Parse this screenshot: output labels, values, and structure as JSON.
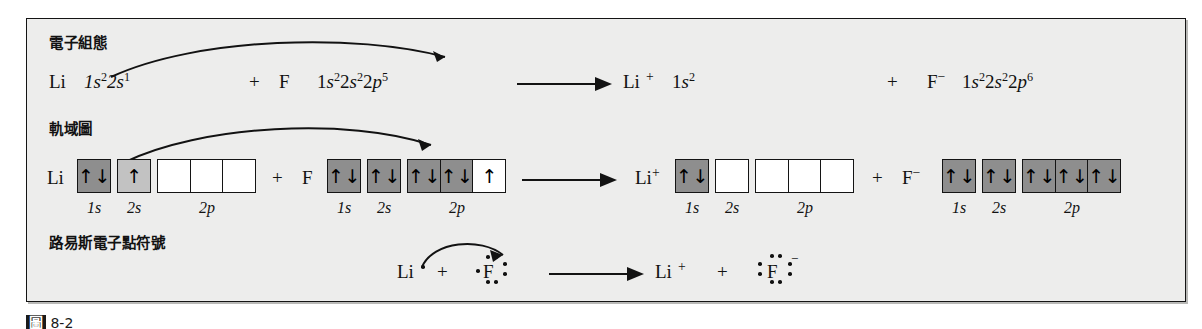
{
  "figure": {
    "background_color": "#ededec",
    "border_color": "#141414",
    "page_color": "#ffffff"
  },
  "rows": {
    "electron_config": {
      "row_label": "電子組態",
      "reactant_li": "Li",
      "reactant_li_config": "1s²2s¹",
      "plus_1": "+",
      "reactant_f": "F",
      "reactant_f_config": "1s²2s²2p⁵",
      "arrow": "reaction-arrow",
      "product_li": "Li",
      "product_li_charge": "+",
      "product_li_config": "1s²",
      "plus_2": "+",
      "product_f": "F",
      "product_f_charge": "−",
      "product_f_config": "1s²2s²2p⁶",
      "transfer_arrow": "electron-transfer-curved-arrow"
    },
    "orbital_diagram": {
      "row_label": "軌域圖",
      "plus_1": "+",
      "plus_2": "+",
      "arrow": "reaction-arrow",
      "transfer_arrow": "electron-transfer-curved-arrow",
      "orbital_labels": [
        "1s",
        "2s",
        "2p"
      ],
      "species": [
        {
          "name": "Li",
          "label": "Li",
          "charge": "",
          "shells": [
            {
              "label": "1s",
              "boxes": [
                {
                  "fill": "gray",
                  "spins": "updown"
                }
              ]
            },
            {
              "label": "2s",
              "boxes": [
                {
                  "fill": "gray2",
                  "spins": "up"
                }
              ]
            },
            {
              "label": "2p",
              "boxes": [
                {
                  "fill": "white",
                  "spins": "none"
                },
                {
                  "fill": "white",
                  "spins": "none"
                },
                {
                  "fill": "white",
                  "spins": "none"
                }
              ]
            }
          ]
        },
        {
          "name": "F",
          "label": "F",
          "charge": "",
          "shells": [
            {
              "label": "1s",
              "boxes": [
                {
                  "fill": "gray",
                  "spins": "updown"
                }
              ]
            },
            {
              "label": "2s",
              "boxes": [
                {
                  "fill": "gray",
                  "spins": "updown"
                }
              ]
            },
            {
              "label": "2p",
              "boxes": [
                {
                  "fill": "gray",
                  "spins": "updown"
                },
                {
                  "fill": "gray",
                  "spins": "updown"
                },
                {
                  "fill": "white",
                  "spins": "up"
                }
              ]
            }
          ]
        },
        {
          "name": "Li-cation",
          "label": "Li",
          "charge": "+",
          "shells": [
            {
              "label": "1s",
              "boxes": [
                {
                  "fill": "gray",
                  "spins": "updown"
                }
              ]
            },
            {
              "label": "2s",
              "boxes": [
                {
                  "fill": "white",
                  "spins": "none"
                }
              ]
            },
            {
              "label": "2p",
              "boxes": [
                {
                  "fill": "white",
                  "spins": "none"
                },
                {
                  "fill": "white",
                  "spins": "none"
                },
                {
                  "fill": "white",
                  "spins": "none"
                }
              ]
            }
          ]
        },
        {
          "name": "F-anion",
          "label": "F",
          "charge": "−",
          "shells": [
            {
              "label": "1s",
              "boxes": [
                {
                  "fill": "gray",
                  "spins": "updown"
                }
              ]
            },
            {
              "label": "2s",
              "boxes": [
                {
                  "fill": "gray",
                  "spins": "updown"
                }
              ]
            },
            {
              "label": "2p",
              "boxes": [
                {
                  "fill": "gray",
                  "spins": "updown"
                },
                {
                  "fill": "gray",
                  "spins": "updown"
                },
                {
                  "fill": "gray",
                  "spins": "updown"
                }
              ]
            }
          ]
        }
      ]
    },
    "lewis": {
      "row_label": "路易斯電子點符號",
      "reactant_li": "Li",
      "plus_1": "+",
      "reactant_f": "F",
      "arrow": "reaction-arrow",
      "product_li": "Li",
      "product_li_charge": "+",
      "plus_2": "+",
      "product_f": "F",
      "product_f_charge": "−",
      "transfer_arrow": "electron-transfer-curved-arrow"
    }
  },
  "caption": {
    "figure_tag": "圖",
    "text": "8-2"
  }
}
